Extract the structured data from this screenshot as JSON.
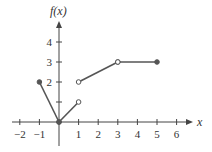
{
  "chart_data": {
    "type": "line",
    "title": "",
    "xlabel": "x",
    "ylabel": "f(x)",
    "xlim": [
      -2.3,
      6.6
    ],
    "ylim": [
      -1.1,
      4.9
    ],
    "x_ticks": [
      -2,
      -1,
      1,
      2,
      3,
      4,
      5,
      6
    ],
    "x_tick_labels": [
      "−2",
      "−1",
      "1",
      "2",
      "3",
      "4",
      "5",
      "6"
    ],
    "y_ticks": [
      1,
      2,
      3,
      4
    ],
    "y_tick_labels": [
      "",
      "2",
      "3",
      "4"
    ],
    "grid": false,
    "legend": null,
    "series": [
      {
        "name": "piece-1",
        "points": [
          [
            -1,
            2
          ],
          [
            0,
            0
          ]
        ],
        "endpoints": [
          "closed",
          "closed"
        ]
      },
      {
        "name": "piece-2",
        "points": [
          [
            0,
            0
          ],
          [
            1,
            1
          ]
        ],
        "endpoints": [
          "closed",
          "open"
        ]
      },
      {
        "name": "piece-3",
        "points": [
          [
            1,
            2
          ],
          [
            3,
            3
          ]
        ],
        "endpoints": [
          "open",
          "open"
        ]
      },
      {
        "name": "piece-4",
        "points": [
          [
            3,
            3
          ],
          [
            5,
            3
          ]
        ],
        "endpoints": [
          "open",
          "closed"
        ]
      }
    ],
    "colors": {
      "line": "#555555",
      "axis": "#444444",
      "text": "#333333"
    }
  }
}
